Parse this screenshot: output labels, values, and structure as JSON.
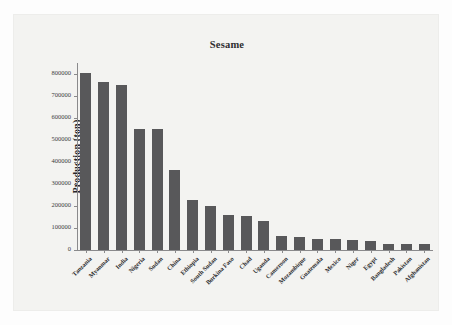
{
  "figure": {
    "title": "Sesame",
    "background_color": "#f3f3f1",
    "bar_color": "#58585a",
    "axis_color": "#8a8a8c"
  },
  "bleed_through_text": {
    "line1": "",
    "line2": ""
  },
  "chart_data": {
    "type": "bar",
    "title": "Sesame",
    "xlabel": "",
    "ylabel": "Production (ton)",
    "ylim": [
      0,
      850000
    ],
    "grid": false,
    "legend": null,
    "ytick_labels": [
      "0",
      "100000",
      "200000",
      "300000",
      "400000",
      "500000",
      "600000",
      "700000",
      "800000"
    ],
    "ytick_values": [
      0,
      100000,
      200000,
      300000,
      400000,
      500000,
      600000,
      700000,
      800000
    ],
    "categories": [
      "Tanzania",
      "Myanmar",
      "India",
      "Nigeria",
      "Sudan",
      "China",
      "Ethiopia",
      "South Sudan",
      "Burkina Faso",
      "Chad",
      "Uganda",
      "Cameroon",
      "Mozambique",
      "Guatemala",
      "Mexico",
      "Niger",
      "Egypt",
      "Bangladesh",
      "Pakistan",
      "Afghanistan"
    ],
    "values": [
      806000,
      765000,
      750000,
      549000,
      549000,
      365000,
      227000,
      202000,
      161000,
      155000,
      132000,
      62000,
      58000,
      52000,
      51000,
      46000,
      41000,
      29000,
      29000,
      28000
    ]
  }
}
